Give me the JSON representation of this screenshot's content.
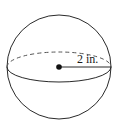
{
  "diagram": {
    "type": "sphere",
    "radius_label": "2 in.",
    "colors": {
      "stroke": "#2a2a2a",
      "background": "#ffffff"
    }
  }
}
